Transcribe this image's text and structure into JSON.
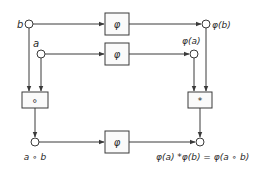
{
  "diagram": {
    "type": "commutative-homomorphism",
    "inputs": {
      "b_label": "b",
      "a_label": "a"
    },
    "boxes": {
      "phi_top": "φ",
      "phi_middle": "φ",
      "compose_left": "∘",
      "compose_right": "*",
      "phi_bottom": "φ"
    },
    "outputs": {
      "phi_b_label": "φ(b)",
      "phi_a_label": "φ(a)",
      "a_comp_b_label": "a ∘ b",
      "equation": "φ(a)  *φ(b) = φ(a ∘ b)"
    },
    "colors": {
      "stroke": "#3a3a3a",
      "text": "#2a2a2a",
      "background": "#ffffff"
    }
  }
}
